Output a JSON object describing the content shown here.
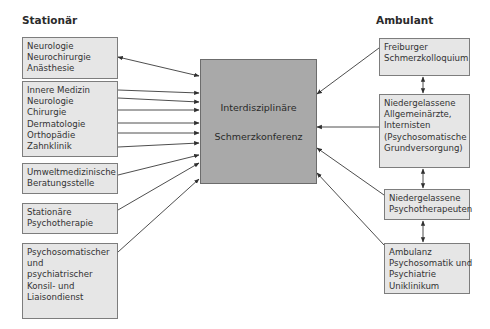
{
  "diagram": {
    "left_header": "Stationär",
    "right_header": "Ambulant",
    "center": {
      "lines": [
        "Interdisziplinäre",
        "Schmerzkonferenz"
      ],
      "fill": "#a9a9a9"
    },
    "left_boxes": [
      {
        "lines": [
          "Neurologie",
          "Neurochirurgie",
          "Anästhesie"
        ],
        "connection": "bidirectional"
      },
      {
        "lines": [
          "Innere Medizin",
          "Neurologie",
          "Chirurgie",
          "Dermatologie",
          "Orthopädie",
          "Zahnklinik"
        ],
        "connection": "to-center (6 arrows)"
      },
      {
        "lines": [
          "Umweltmedizinische",
          "Beratungsstelle"
        ],
        "connection": "to-center"
      },
      {
        "lines": [
          "Stationäre",
          "Psychotherapie"
        ],
        "connection": "to-center"
      },
      {
        "lines": [
          "Psychosomatischer",
          "und",
          "psychiatrischer",
          "Konsil- und",
          "Liaisondienst"
        ],
        "connection": "to-center"
      }
    ],
    "right_boxes": [
      {
        "lines": [
          "Freiburger",
          "Schmerzkolloquium"
        ],
        "connection": "to-center"
      },
      {
        "lines": [
          "Niedergelassene",
          "Allgemeinärzte,",
          "Internisten",
          "(Psychosomatische",
          "Grundversorgung)"
        ],
        "connection": "to-center"
      },
      {
        "lines": [
          "Niedergelassene",
          "Psychotherapeuten"
        ],
        "connection": "to-center"
      },
      {
        "lines": [
          "Ambulanz",
          "Psychosomatik und",
          "Psychiatrie",
          "Uniklinikum"
        ],
        "connection": "to-center"
      }
    ],
    "right_vertical_links": [
      "bidirectional",
      "bidirectional",
      "bidirectional"
    ],
    "colors": {
      "box_fill": "#e6e6e6",
      "border": "#7d7d7d",
      "line": "#333333"
    }
  }
}
